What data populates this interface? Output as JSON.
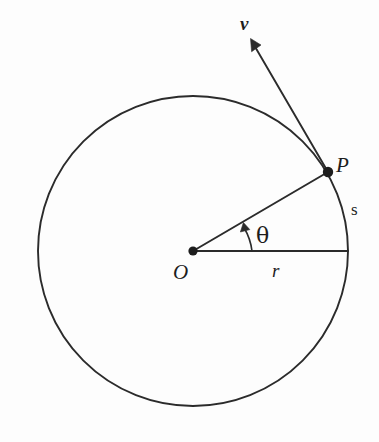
{
  "figure": {
    "background_color": "#fdfdfd",
    "stroke_color": "#2b2b2b",
    "labels": {
      "center": "O",
      "point_on_circle": "P",
      "radius": "r",
      "arc_length": "s",
      "angle": "θ",
      "velocity": "v"
    },
    "geometry": {
      "circle_center_x": 193,
      "circle_center_y": 251,
      "circle_radius": 155,
      "point_p_x": 328,
      "point_p_y": 172,
      "angle_theta_degrees": 30.3,
      "theta_arc_radius": 59,
      "radius_line_end_x": 348,
      "radius_line_end_y": 251,
      "velocity_tip_x": 252,
      "velocity_tip_y": 41
    }
  }
}
